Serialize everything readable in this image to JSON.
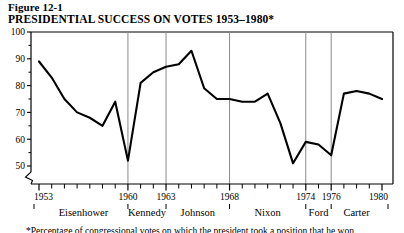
{
  "figure": {
    "number_label": "Figure 12-1",
    "title": "PRESIDENTIAL SUCCESS ON VOTES 1953–1980*",
    "footnote": "*Percentage of congressional votes on which the president took a position that he won."
  },
  "chart_data": {
    "type": "line",
    "title": "PRESIDENTIAL SUCCESS ON VOTES 1953–1980*",
    "xlabel": "",
    "ylabel": "",
    "xlim": [
      1953,
      1980
    ],
    "ylim": [
      45,
      100
    ],
    "y_axis_broken": true,
    "grid": false,
    "legend": "none",
    "ytick_labels": [
      "50",
      "60",
      "70",
      "80",
      "90",
      "100"
    ],
    "ytick_values": [
      50,
      60,
      70,
      80,
      90,
      100
    ],
    "xtick_labels": [
      "1953",
      "1960",
      "1963",
      "1968",
      "1974",
      "1976",
      "1980"
    ],
    "xtick_values": [
      1953,
      1960,
      1963,
      1968,
      1974,
      1976,
      1980
    ],
    "x_minor_ticks": [
      1954,
      1955,
      1956,
      1957,
      1958,
      1959,
      1961,
      1962,
      1964,
      1965,
      1966,
      1967,
      1969,
      1970,
      1971,
      1972,
      1973,
      1975,
      1977,
      1978,
      1979
    ],
    "divider_years": [
      1960,
      1963,
      1968,
      1974,
      1976
    ],
    "x": [
      1953,
      1954,
      1955,
      1956,
      1957,
      1958,
      1959,
      1960,
      1961,
      1962,
      1963,
      1964,
      1965,
      1966,
      1967,
      1968,
      1969,
      1970,
      1971,
      1972,
      1973,
      1974,
      1975,
      1976,
      1977,
      1978,
      1979,
      1980
    ],
    "values": [
      89,
      83,
      75,
      70,
      68,
      65,
      74,
      52,
      81,
      85,
      87,
      88,
      93,
      79,
      75,
      75,
      74,
      74,
      77,
      66,
      51,
      59,
      58,
      54,
      77,
      78,
      77,
      75
    ],
    "series": [
      {
        "name": "Presidential success on votes",
        "values": [
          89,
          83,
          75,
          70,
          68,
          65,
          74,
          52,
          81,
          85,
          87,
          88,
          93,
          79,
          75,
          75,
          74,
          74,
          77,
          66,
          51,
          59,
          58,
          54,
          77,
          78,
          77,
          75
        ]
      }
    ],
    "presidents": [
      {
        "name": "Eisenhower",
        "start": 1953,
        "end": 1960
      },
      {
        "name": "Kennedy",
        "start": 1960,
        "end": 1963
      },
      {
        "name": "Johnson",
        "start": 1963,
        "end": 1968
      },
      {
        "name": "Nixon",
        "start": 1968,
        "end": 1974
      },
      {
        "name": "Ford",
        "start": 1974,
        "end": 1976
      },
      {
        "name": "Carter",
        "start": 1976,
        "end": 1980
      }
    ],
    "colors": {
      "line": "#000000",
      "axis": "#000000",
      "divider": "#8a8a8a",
      "background": "#ffffff"
    }
  }
}
